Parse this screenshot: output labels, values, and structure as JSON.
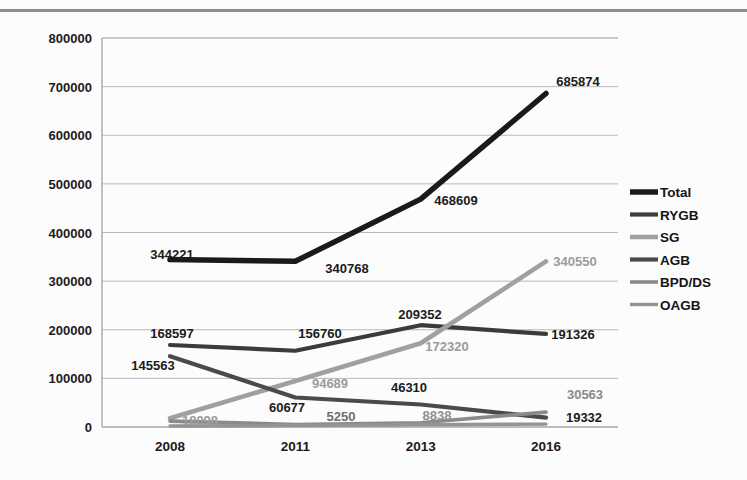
{
  "chart_data": {
    "type": "line",
    "title": "",
    "xlabel": "",
    "ylabel": "",
    "x": [
      "2008",
      "2011",
      "2013",
      "2016"
    ],
    "categories": [
      "2008",
      "2011",
      "2013",
      "2016"
    ],
    "ylim": [
      0,
      800000
    ],
    "ytick_labels": [
      "800000",
      "700000",
      "600000",
      "500000",
      "400000",
      "300000",
      "200000",
      "100000",
      "0"
    ],
    "ytick_values": [
      800000,
      700000,
      600000,
      500000,
      400000,
      300000,
      200000,
      100000,
      0
    ],
    "grid": true,
    "legend_position": "right",
    "series": [
      {
        "name": "Total",
        "color": "#1a1a1a",
        "values": [
          344221,
          340768,
          468609,
          685874
        ],
        "labels": [
          "344221",
          "340768",
          "468609",
          "685874"
        ]
      },
      {
        "name": "RYGB",
        "color": "#3b3b3b",
        "values": [
          168597,
          156760,
          209352,
          191326
        ],
        "labels": [
          "168597",
          "156760",
          "209352",
          "191326"
        ]
      },
      {
        "name": "SG",
        "color": "#a0a0a0",
        "values": [
          18098,
          94689,
          172320,
          340550
        ],
        "labels": [
          "18098",
          "94689",
          "172320",
          "340550"
        ]
      },
      {
        "name": "AGB",
        "color": "#4a4a4a",
        "values": [
          145563,
          60677,
          46310,
          19332
        ],
        "labels": [
          "145563",
          "60677",
          "46310",
          "19332"
        ]
      },
      {
        "name": "BPD/DS",
        "color": "#8a8a8a",
        "values": [
          12000,
          5250,
          8838,
          30563
        ],
        "labels": [
          "",
          "5250",
          "8838",
          "30563"
        ]
      },
      {
        "name": "OAGB",
        "color": "#949494",
        "values": [
          2000,
          3000,
          4500,
          6000
        ],
        "labels": [
          "",
          "",
          "",
          ""
        ]
      }
    ],
    "legend": [
      {
        "label": "Total",
        "color": "#1a1a1a"
      },
      {
        "label": "RYGB",
        "color": "#3b3b3b"
      },
      {
        "label": "SG",
        "color": "#a0a0a0"
      },
      {
        "label": "AGB",
        "color": "#4a4a4a"
      },
      {
        "label": "BPD/DS",
        "color": "#8a8a8a"
      },
      {
        "label": "OAGB",
        "color": "#949494"
      }
    ],
    "data_labels": [
      {
        "text": "344221",
        "x": 172,
        "y": 259,
        "color": "#1b1b1b",
        "anchor": "middle"
      },
      {
        "text": "340768",
        "x": 347,
        "y": 273,
        "color": "#1b1b1b",
        "anchor": "middle"
      },
      {
        "text": "468609",
        "x": 456,
        "y": 205,
        "color": "#1b1b1b",
        "anchor": "middle"
      },
      {
        "text": "685874",
        "x": 578,
        "y": 86,
        "color": "#1b1b1b",
        "anchor": "middle"
      },
      {
        "text": "168597",
        "x": 172,
        "y": 338,
        "color": "#1b1b1b",
        "anchor": "middle"
      },
      {
        "text": "156760",
        "x": 320,
        "y": 338,
        "color": "#1b1b1b",
        "anchor": "middle"
      },
      {
        "text": "209352",
        "x": 420,
        "y": 319,
        "color": "#1b1b1b",
        "anchor": "middle"
      },
      {
        "text": "191326",
        "x": 573,
        "y": 339,
        "color": "#1b1b1b",
        "anchor": "middle"
      },
      {
        "text": "145563",
        "x": 153,
        "y": 370,
        "color": "#1b1b1b",
        "anchor": "middle"
      },
      {
        "text": "60677",
        "x": 287,
        "y": 412,
        "color": "#1b1b1b",
        "anchor": "middle"
      },
      {
        "text": "46310",
        "x": 409,
        "y": 392,
        "color": "#1b1b1b",
        "anchor": "middle"
      },
      {
        "text": "19332",
        "x": 584,
        "y": 422,
        "color": "#1b1b1b",
        "anchor": "middle"
      },
      {
        "text": "18098",
        "x": 200,
        "y": 425,
        "color": "#9b9b9b",
        "anchor": "middle"
      },
      {
        "text": "94689",
        "x": 330,
        "y": 388,
        "color": "#9b9b9b",
        "anchor": "middle"
      },
      {
        "text": "172320",
        "x": 447,
        "y": 351,
        "color": "#9b9b9b",
        "anchor": "middle"
      },
      {
        "text": "340550",
        "x": 575,
        "y": 266,
        "color": "#9b9b9b",
        "anchor": "middle"
      },
      {
        "text": "5250",
        "x": 341,
        "y": 421,
        "color": "#6f6f6f",
        "anchor": "middle"
      },
      {
        "text": "8838",
        "x": 437,
        "y": 420,
        "color": "#8f8f8f",
        "anchor": "middle"
      },
      {
        "text": "30563",
        "x": 585,
        "y": 399,
        "color": "#8a8a8a",
        "anchor": "middle"
      }
    ]
  },
  "plot": {
    "left": 102,
    "right": 618,
    "top": 38,
    "bottom": 427
  }
}
